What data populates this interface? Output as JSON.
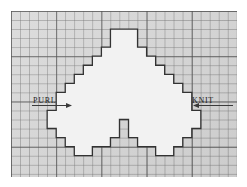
{
  "page": {
    "background_color": "#ffffff"
  },
  "sheet": {
    "name": "graph-paper",
    "fill_color": "#d9d9d9",
    "minor_cell_px": 9,
    "major_every_n_cells": 5,
    "columns": 25,
    "rows": 18,
    "minor_line_color": "#6e6e6e",
    "major_line_color": "#464646"
  },
  "annotations": {
    "left": {
      "label": "PURL",
      "arrow_direction": "right",
      "arrow_color": "#3a3a3a"
    },
    "right": {
      "label": "KNIT",
      "arrow_direction": "left",
      "arrow_color": "#3a3a3a"
    }
  },
  "motif": {
    "name": "leaf-motif",
    "description": "Pixelated stepped leaf shape outlined on the knitting grid",
    "fill_color": "#f2f2f2",
    "stroke_color": "#333333",
    "stroke_width": 1.3,
    "cell_px": 9.04,
    "origin_cell": [
      0,
      0
    ],
    "outline_cells": [
      [
        12,
        2
      ],
      [
        14,
        2
      ],
      [
        14,
        4
      ],
      [
        15,
        4
      ],
      [
        15,
        5
      ],
      [
        16,
        5
      ],
      [
        16,
        6
      ],
      [
        17,
        6
      ],
      [
        17,
        7
      ],
      [
        18,
        7
      ],
      [
        18,
        8
      ],
      [
        19,
        8
      ],
      [
        19,
        9
      ],
      [
        20,
        9
      ],
      [
        20,
        11
      ],
      [
        21,
        11
      ],
      [
        21,
        13
      ],
      [
        20,
        13
      ],
      [
        20,
        14
      ],
      [
        19,
        14
      ],
      [
        19,
        15
      ],
      [
        18,
        15
      ],
      [
        18,
        16
      ],
      [
        16,
        16
      ],
      [
        16,
        15
      ],
      [
        14,
        15
      ],
      [
        14,
        14
      ],
      [
        13,
        14
      ],
      [
        13,
        12
      ],
      [
        12,
        12
      ],
      [
        12,
        14
      ],
      [
        11,
        14
      ],
      [
        11,
        15
      ],
      [
        9,
        15
      ],
      [
        9,
        16
      ],
      [
        7,
        16
      ],
      [
        7,
        15
      ],
      [
        6,
        15
      ],
      [
        6,
        14
      ],
      [
        5,
        14
      ],
      [
        5,
        13
      ],
      [
        4,
        13
      ],
      [
        4,
        11
      ],
      [
        5,
        11
      ],
      [
        5,
        9
      ],
      [
        6,
        9
      ],
      [
        6,
        8
      ],
      [
        7,
        8
      ],
      [
        7,
        7
      ],
      [
        8,
        7
      ],
      [
        8,
        6
      ],
      [
        9,
        6
      ],
      [
        9,
        5
      ],
      [
        10,
        5
      ],
      [
        10,
        4
      ],
      [
        11,
        4
      ],
      [
        11,
        2
      ]
    ]
  }
}
